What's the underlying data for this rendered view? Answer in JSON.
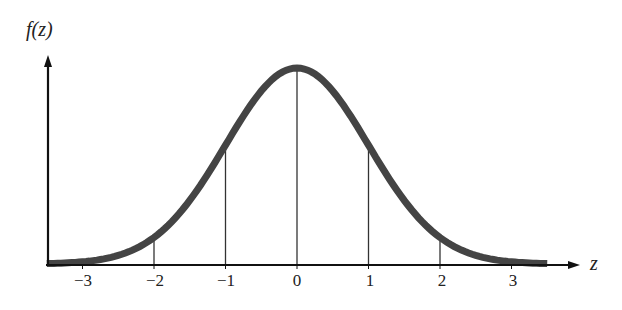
{
  "chart_data": {
    "type": "line",
    "title": "",
    "xlabel": "z",
    "ylabel": "f(z)",
    "x_ticks": [
      -3,
      -2,
      -1,
      0,
      1,
      2,
      3
    ],
    "tick_labels": [
      "−3",
      "−2",
      "−1",
      "0",
      "1",
      "2",
      "3"
    ],
    "xlim": [
      -3.5,
      3.5
    ],
    "series": [
      {
        "name": "f(z)",
        "x": [
          -3.5,
          -3,
          -2.5,
          -2,
          -1.5,
          -1,
          -0.5,
          0,
          0.5,
          1,
          1.5,
          2,
          2.5,
          3,
          3.5
        ],
        "values": [
          0.0009,
          0.0044,
          0.0175,
          0.054,
          0.1295,
          0.242,
          0.3521,
          0.3989,
          0.3521,
          0.242,
          0.1295,
          0.054,
          0.0175,
          0.0044,
          0.0009
        ]
      }
    ],
    "vertical_lines_at": [
      -2,
      -1,
      0,
      1,
      2
    ],
    "grid": false,
    "legend": "none",
    "colors": {
      "curve": "#444444",
      "axes": "#111111",
      "lines": "#333333"
    }
  },
  "labels": {
    "y_axis": "f(z)",
    "x_axis": "z",
    "ticks": [
      "−3",
      "−2",
      "−1",
      "0",
      "1",
      "2",
      "3"
    ]
  }
}
